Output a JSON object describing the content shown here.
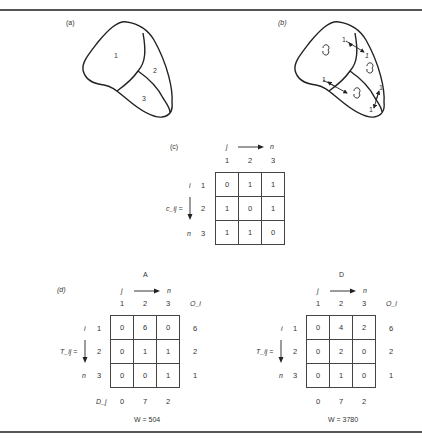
{
  "panels": {
    "a": {
      "label": "(a)",
      "regions": [
        "1",
        "2",
        "3"
      ]
    },
    "b": {
      "label": "(b)",
      "flow_labels": [
        "1",
        "1",
        "1",
        "1",
        "1",
        "1"
      ]
    },
    "c": {
      "label": "(c)",
      "col_axis": {
        "from": "j",
        "to": "n"
      },
      "row_axis": {
        "from": "i",
        "to": "n"
      },
      "matrix_label": "c_ij =",
      "col_headers": [
        "1",
        "2",
        "3"
      ],
      "row_headers": [
        "1",
        "2",
        "3"
      ],
      "rows": [
        [
          "0",
          "1",
          "1"
        ],
        [
          "1",
          "0",
          "1"
        ],
        [
          "1",
          "1",
          "0"
        ]
      ]
    },
    "d": {
      "label": "(d)",
      "tables": [
        {
          "title": "A",
          "col_axis": {
            "from": "j",
            "to": "n"
          },
          "row_axis": {
            "from": "i",
            "to": "n"
          },
          "matrix_label": "T_ij =",
          "col_headers": [
            "1",
            "2",
            "3"
          ],
          "origin_header": "O_i",
          "row_headers": [
            "1",
            "2",
            "3"
          ],
          "rows": [
            [
              "0",
              "6",
              "0"
            ],
            [
              "0",
              "1",
              "1"
            ],
            [
              "0",
              "0",
              "1"
            ]
          ],
          "origin_totals": [
            "6",
            "2",
            "1"
          ],
          "dest_label": "D_j",
          "dest_totals": [
            "0",
            "7",
            "2"
          ],
          "w_value": "W = 504"
        },
        {
          "title": "D",
          "col_axis": {
            "from": "j",
            "to": "n"
          },
          "row_axis": {
            "from": "i",
            "to": "n"
          },
          "matrix_label": "T_ij =",
          "col_headers": [
            "1",
            "2",
            "3"
          ],
          "origin_header": "O_i",
          "row_headers": [
            "1",
            "2",
            "3"
          ],
          "rows": [
            [
              "0",
              "4",
              "2"
            ],
            [
              "0",
              "2",
              "0"
            ],
            [
              "0",
              "1",
              "0"
            ]
          ],
          "origin_totals": [
            "6",
            "2",
            "1"
          ],
          "dest_totals": [
            "0",
            "7",
            "2"
          ],
          "w_value": "W = 3780"
        }
      ]
    }
  },
  "colors": {
    "ink": "#222222",
    "rule": "#555555",
    "background": "#ffffff"
  }
}
